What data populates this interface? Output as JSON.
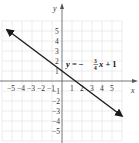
{
  "chart_data": {
    "type": "line",
    "title": "",
    "xlabel": "x",
    "ylabel": "y",
    "xlim": [
      -6,
      6
    ],
    "ylim": [
      -6,
      6
    ],
    "grid": true,
    "x_ticks": [
      -5,
      -4,
      -3,
      -2,
      -1,
      1,
      2,
      3,
      4,
      5
    ],
    "y_ticks": [
      5,
      4,
      3,
      2,
      1,
      -1,
      -2,
      -3,
      -4,
      -5
    ],
    "series": [
      {
        "name": "y = -3/4 x + 1",
        "equation": "y = -(3/4)x + 1",
        "slope": -0.75,
        "intercept": 1,
        "x": [
          -5.5,
          6
        ],
        "y": [
          5.125,
          -3.5
        ],
        "arrows": "both",
        "color": "#1a1a1a"
      }
    ],
    "annotations": [
      {
        "text": "y = -3/4 x + 1",
        "x": 1.3,
        "y": 1.8
      }
    ]
  },
  "labels": {
    "x_axis": "x",
    "y_axis": "y",
    "eq_y": "y",
    "eq_eq": " = −",
    "eq_num": "3",
    "eq_den": "4",
    "eq_x": "x",
    "eq_tail": " + 1"
  },
  "colors": {
    "grid": "#d9d9d9",
    "axis": "#555555",
    "line": "#1a1a1a"
  }
}
